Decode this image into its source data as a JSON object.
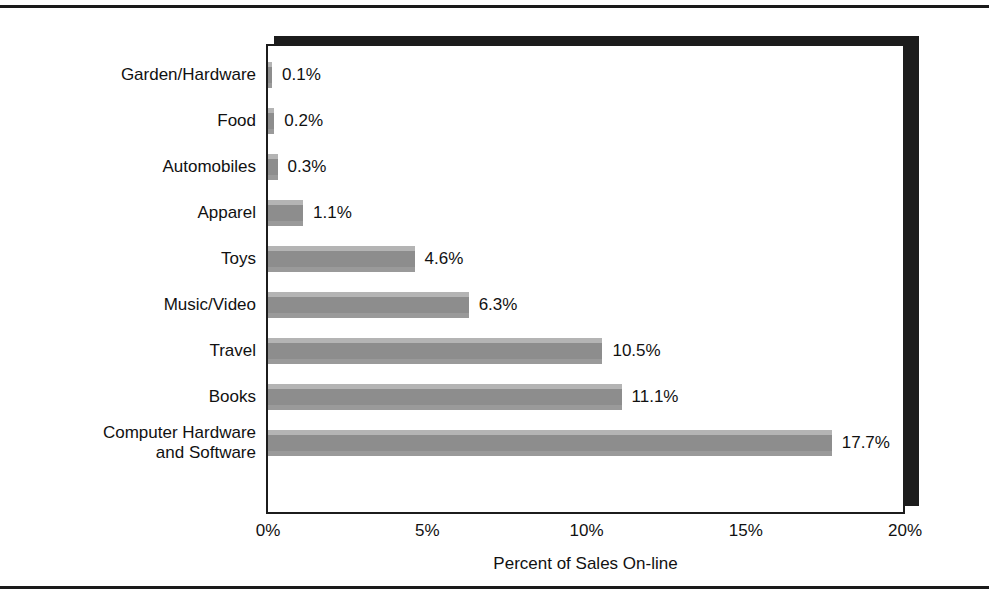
{
  "chart_data": {
    "type": "bar",
    "orientation": "horizontal",
    "title": "",
    "xlabel": "Percent of Sales On-line",
    "ylabel": "",
    "xlim": [
      0,
      20
    ],
    "xticks": [
      "0%",
      "5%",
      "10%",
      "15%",
      "20%"
    ],
    "xtick_values": [
      0,
      5,
      10,
      15,
      20
    ],
    "grid": false,
    "legend": false,
    "categories": [
      "Garden/Hardware",
      "Food",
      "Automobiles",
      "Apparel",
      "Toys",
      "Music/Video",
      "Travel",
      "Books",
      "Computer Hardware\nand Software"
    ],
    "values": [
      0.1,
      0.2,
      0.3,
      1.1,
      4.6,
      6.3,
      10.5,
      11.1,
      17.7
    ],
    "value_labels": [
      "0.1%",
      "0.2%",
      "0.3%",
      "1.1%",
      "4.6%",
      "6.3%",
      "10.5%",
      "11.1%",
      "17.7%"
    ],
    "bar_color": "#8d8d8d",
    "bar_highlight_color": "#b4b4b4",
    "axis_color": "#1c1c1c",
    "background_color": "#ffffff"
  }
}
